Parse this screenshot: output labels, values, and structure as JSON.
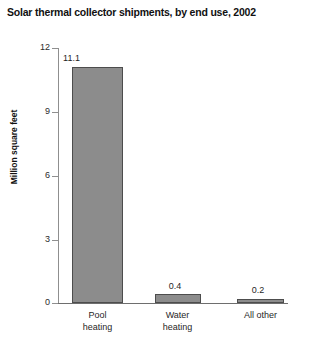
{
  "chart_data": {
    "type": "bar",
    "title": "Solar thermal collector shipments, by end use, 2002",
    "xlabel": "",
    "ylabel": "Million square feet",
    "categories": [
      "Pool heating",
      "Water heating",
      "All other"
    ],
    "category_lines": [
      [
        "Pool",
        "heating"
      ],
      [
        "Water",
        "heating"
      ],
      [
        "All other"
      ]
    ],
    "values": [
      11.1,
      0.4,
      0.2
    ],
    "value_labels": [
      "11.1",
      "0.4",
      "0.2"
    ],
    "ylim": [
      0,
      12
    ],
    "yticks": [
      0,
      3,
      6,
      9,
      12
    ],
    "ytick_labels": [
      "0",
      "3",
      "6",
      "9",
      "12"
    ],
    "grid": false,
    "legend": false,
    "bar_color": "#8c8c8c",
    "bar_border_color": "#4d4d4d",
    "axis_color": "#6e6e6e",
    "text_color": "#1f1f1f"
  }
}
